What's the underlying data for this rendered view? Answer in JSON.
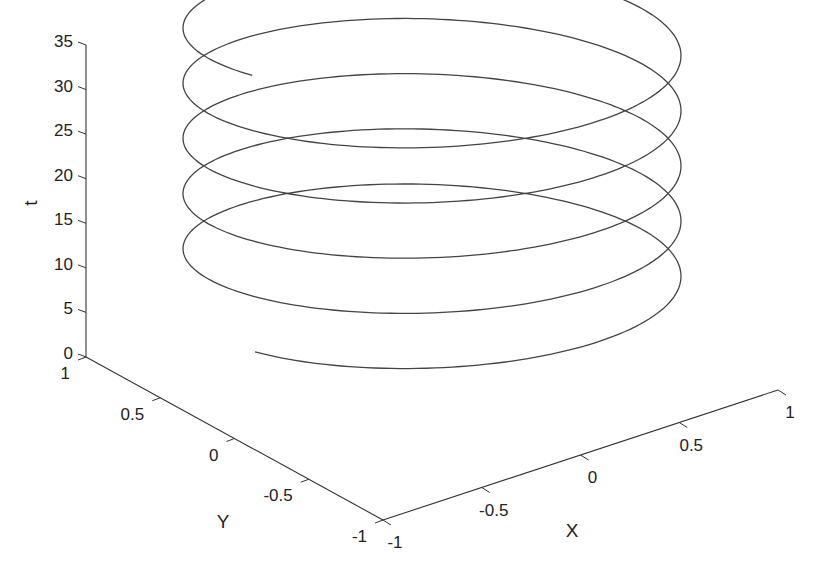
{
  "chart_data": {
    "type": "line3d",
    "title": "",
    "xlabel": "X",
    "ylabel": "Y",
    "zlabel": "t",
    "xlim": [
      -1,
      1
    ],
    "ylim": [
      -1,
      1
    ],
    "zlim": [
      0,
      35
    ],
    "x_ticks": [
      -1,
      -0.5,
      0,
      0.5,
      1
    ],
    "x_tick_labels": [
      "-1",
      "-0.5",
      "0",
      "0.5",
      "1"
    ],
    "y_ticks": [
      1,
      0.5,
      0,
      -0.5,
      -1
    ],
    "y_tick_labels": [
      "1",
      "0.5",
      "0",
      "-0.5",
      "-1"
    ],
    "z_ticks": [
      0,
      5,
      10,
      15,
      20,
      25,
      30,
      35
    ],
    "z_tick_labels": [
      "0",
      "5",
      "10",
      "15",
      "20",
      "25",
      "30",
      "35"
    ],
    "grid": false,
    "legend": null,
    "series": [
      {
        "name": "helix",
        "x_expr": "sin(t)",
        "y_expr": "cos(t)",
        "z_expr": "t",
        "t_range": [
          0,
          31.4
        ],
        "turns": 5,
        "color": "#444444"
      }
    ]
  },
  "axes": {
    "x_label": "X",
    "y_label": "Y",
    "z_label": "t"
  }
}
